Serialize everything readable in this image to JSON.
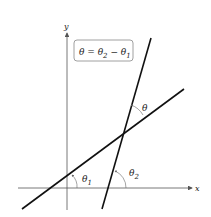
{
  "diagram": {
    "axes": {
      "x_label": "x",
      "y_label": "y"
    },
    "formula_box": {
      "text": "θ = θ₂ − θ₁",
      "theta": "θ",
      "eq": " = ",
      "minus": " − ",
      "sub2": "2",
      "sub1": "1"
    },
    "angles": [
      {
        "name": "theta",
        "label": "θ",
        "subscript": ""
      },
      {
        "name": "theta1",
        "label": "θ",
        "subscript": "1"
      },
      {
        "name": "theta2",
        "label": "θ",
        "subscript": "2"
      }
    ],
    "lines": [
      {
        "name": "line-1",
        "from": [
          22,
          209
        ],
        "to": [
          184,
          89
        ]
      },
      {
        "name": "line-2",
        "from": [
          102,
          209
        ],
        "to": [
          151,
          38
        ]
      }
    ],
    "colors": {
      "line": "#111111",
      "axis": "#555555",
      "box_border": "#888888",
      "arc": "#666666"
    }
  }
}
